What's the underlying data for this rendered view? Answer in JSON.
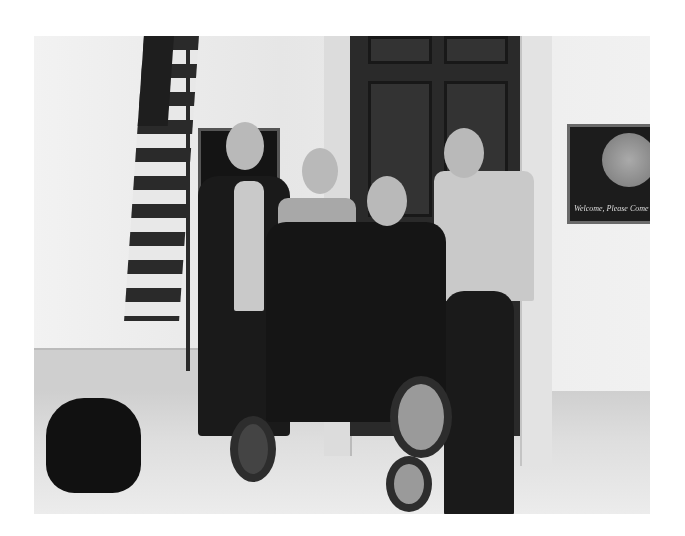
{
  "photo": {
    "description": "Black and white photo of four people in an office hallway; man in a power wheelchair, a service dog lying on the floor, American flag, wooden door",
    "plaque_right_text": "Welcome, Please Come",
    "plaque_left_text": ""
  }
}
